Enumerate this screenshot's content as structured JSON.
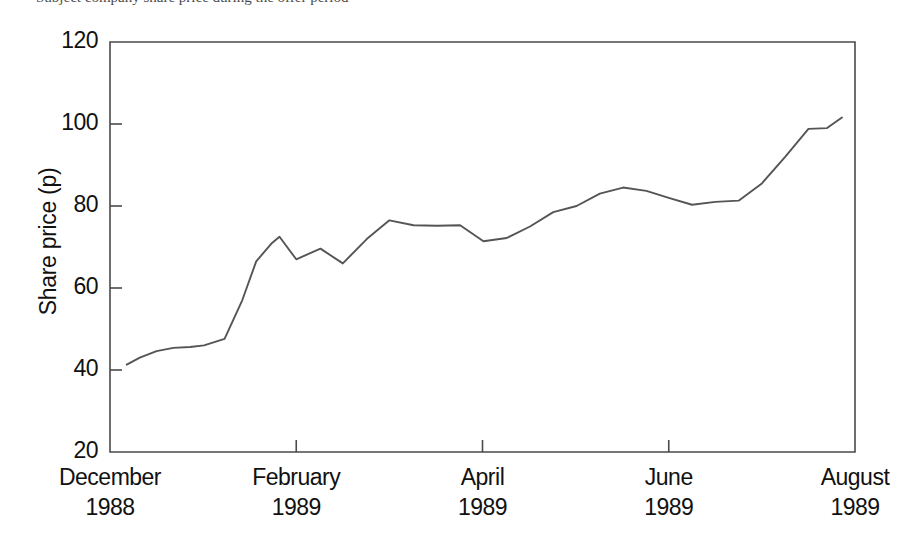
{
  "caption": {
    "text": "Subject company share price during the offer period"
  },
  "chart_data": {
    "type": "line",
    "title": "",
    "xlabel": "",
    "ylabel": "Share price (p)",
    "ylim": [
      20,
      120
    ],
    "yticks": [
      20,
      40,
      60,
      80,
      100,
      120
    ],
    "ytick_labels": [
      "20",
      "40",
      "60",
      "80",
      "100",
      "120"
    ],
    "xtick_labels": [
      {
        "month": "December",
        "year": "1988"
      },
      {
        "month": "February",
        "year": "1989"
      },
      {
        "month": "April",
        "year": "1989"
      },
      {
        "month": "June",
        "year": "1989"
      },
      {
        "month": "August",
        "year": "1989"
      }
    ],
    "xtick_positions_months": [
      0,
      2,
      4,
      6,
      8
    ],
    "xlim_months": [
      0,
      8
    ],
    "grid": false,
    "legend": false,
    "series": [
      {
        "name": "Share price",
        "x_months": [
          0.18,
          0.32,
          0.5,
          0.68,
          0.86,
          1.01,
          1.23,
          1.42,
          1.57,
          1.74,
          1.82,
          2.0,
          2.26,
          2.5,
          2.76,
          3.0,
          3.26,
          3.51,
          3.76,
          4.01,
          4.26,
          4.51,
          4.76,
          5.01,
          5.26,
          5.51,
          5.76,
          6.0,
          6.25,
          6.5,
          6.75,
          7.0,
          7.25,
          7.5,
          7.7,
          7.86
        ],
        "values": [
          41.3,
          43.0,
          44.6,
          45.4,
          45.6,
          46.0,
          47.6,
          57.0,
          66.5,
          71.0,
          72.5,
          67.0,
          69.6,
          66.0,
          72.0,
          76.5,
          75.3,
          75.2,
          75.3,
          71.4,
          72.2,
          75.0,
          78.5,
          80.0,
          83.0,
          84.5,
          83.7,
          82.0,
          80.3,
          81.0,
          81.3,
          85.5,
          92.0,
          98.8,
          99.0,
          101.6
        ]
      }
    ]
  }
}
